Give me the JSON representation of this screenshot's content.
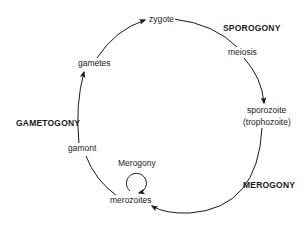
{
  "diagram": {
    "type": "life-cycle",
    "stages": [
      {
        "id": "zygote",
        "label": "zygote"
      },
      {
        "id": "meiosis",
        "label": "meiosis"
      },
      {
        "id": "sporozoite",
        "label": "sporozoite",
        "sublabel": "(trophozoite)"
      },
      {
        "id": "merozoites",
        "label": "merozoites"
      },
      {
        "id": "gamont",
        "label": "gamont"
      },
      {
        "id": "gametes",
        "label": "gametes"
      }
    ],
    "phases": {
      "sporogony": "SPOROGONY",
      "merogony": "MEROGONY",
      "gametogony": "GAMETOGONY"
    },
    "loop": {
      "label": "Merogony"
    },
    "edges": [
      {
        "from": "gametes",
        "to": "zygote"
      },
      {
        "from": "zygote",
        "to": "meiosis"
      },
      {
        "from": "meiosis",
        "to": "sporozoite"
      },
      {
        "from": "sporozoite",
        "to": "merozoites"
      },
      {
        "from": "merozoites",
        "to": "merozoites",
        "label": "Merogony"
      },
      {
        "from": "merozoites",
        "to": "gamont"
      },
      {
        "from": "gamont",
        "to": "gametes"
      }
    ],
    "colors": {
      "line": "#1a1a1a",
      "background": "#ffffff"
    }
  }
}
